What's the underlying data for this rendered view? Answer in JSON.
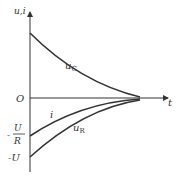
{
  "diagram": {
    "type": "rc-transient-curves",
    "axes": {
      "y_label": "u,i",
      "x_label": "t",
      "origin_label": "O"
    },
    "y_ticks": [
      {
        "label_num": "U",
        "label_den": "R",
        "prefix": "-"
      },
      {
        "label": "-U"
      }
    ],
    "curves": [
      {
        "name": "u_C",
        "label": "u",
        "sub": "C",
        "shape": "exponential decay from positive value to 0"
      },
      {
        "name": "i",
        "label": "i",
        "shape": "exponential rise from -U/R to 0"
      },
      {
        "name": "u_R",
        "label": "u",
        "sub": "R",
        "shape": "exponential rise from -U to 0"
      }
    ],
    "colors": {
      "line": "#333333",
      "background": "#ffffff"
    }
  }
}
